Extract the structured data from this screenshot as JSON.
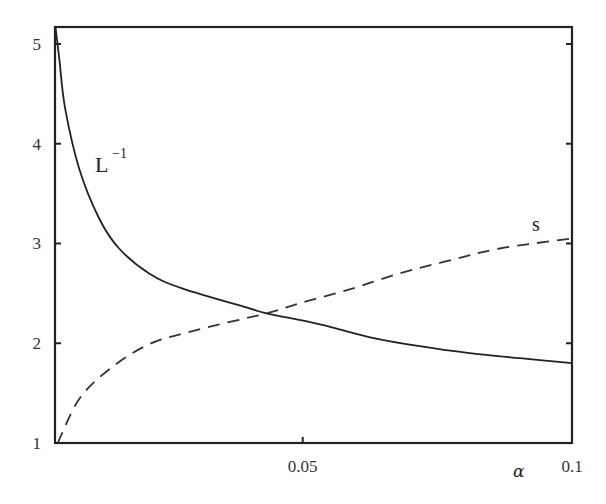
{
  "chart_data": {
    "type": "line",
    "title": "",
    "xlabel": "α",
    "ylabel": "",
    "xlim": [
      0.004,
      0.1
    ],
    "ylim": [
      1,
      5.17
    ],
    "grid": false,
    "legend": "none (inline curve labels)",
    "x_ticks": [
      0.05,
      0.1
    ],
    "x_tick_labels": [
      "0.05",
      "0.1"
    ],
    "y_ticks": [
      1,
      2,
      3,
      4,
      5
    ],
    "y_tick_labels": [
      "1",
      "2",
      "3",
      "4",
      "5"
    ],
    "series": [
      {
        "name": "L^-1",
        "style": "solid",
        "color": "#222222",
        "x": [
          0.0041,
          0.0048,
          0.0059,
          0.0085,
          0.0122,
          0.0159,
          0.0215,
          0.0276,
          0.0401,
          0.0433,
          0.0532,
          0.0625,
          0.0717,
          0.081,
          0.0903,
          0.1
        ],
        "y": [
          5.17,
          4.85,
          4.35,
          3.75,
          3.25,
          2.95,
          2.7,
          2.55,
          2.35,
          2.3,
          2.19,
          2.06,
          1.97,
          1.9,
          1.85,
          1.8
        ]
      },
      {
        "name": "s",
        "style": "dashed",
        "color": "#333333",
        "x": [
          0.0045,
          0.0085,
          0.0141,
          0.0215,
          0.0308,
          0.0433,
          0.0494,
          0.0587,
          0.068,
          0.0773,
          0.0866,
          0.1
        ],
        "y": [
          1.0,
          1.44,
          1.74,
          1.99,
          2.14,
          2.3,
          2.4,
          2.54,
          2.7,
          2.83,
          2.95,
          3.05
        ]
      }
    ],
    "annotations": [
      {
        "text": "L",
        "superscript": "−1",
        "near_series": "L^-1",
        "x": 0.0114,
        "y": 3.9
      },
      {
        "text": "s",
        "near_series": "s",
        "x": 0.0935,
        "y": 3.15
      },
      {
        "text": "crossing",
        "x": 0.0433,
        "y": 2.3
      }
    ]
  },
  "labels": {
    "curve_L_main": "L",
    "curve_L_sup": "−1",
    "curve_s": "s",
    "x_axis": "α"
  }
}
